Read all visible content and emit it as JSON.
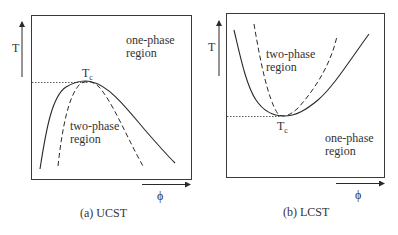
{
  "panels": [
    {
      "id": "ucst",
      "caption": "(a) UCST",
      "y_axis_label": "T",
      "x_axis_label": "ϕ",
      "critical_point_label": "T",
      "critical_point_sub": "c",
      "one_phase_label_line1": "one-phase",
      "one_phase_label_line2": "region",
      "two_phase_label_line1": "two-phase",
      "two_phase_label_line2": "region"
    },
    {
      "id": "lcst",
      "caption": "(b) LCST",
      "y_axis_label": "T",
      "x_axis_label": "ϕ",
      "critical_point_label": "T",
      "critical_point_sub": "c",
      "one_phase_label_line1": "one-phase",
      "one_phase_label_line2": "region",
      "two_phase_label_line1": "two-phase",
      "two_phase_label_line2": "region"
    }
  ],
  "colors": {
    "line": "#2a2a2a",
    "frame": "#3a3a3a"
  }
}
